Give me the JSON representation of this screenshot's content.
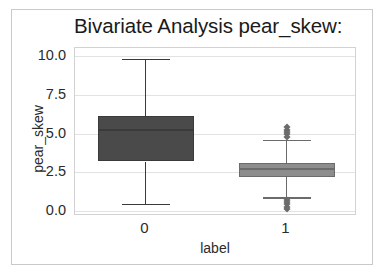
{
  "chart_data": {
    "type": "box",
    "title": "Bivariate Analysis pear_skew:",
    "xlabel": "label",
    "ylabel": "pear_skew",
    "ylim": [
      -0.3,
      10.5
    ],
    "yticks": [
      "0.0",
      "2.5",
      "5.0",
      "7.5",
      "10.0"
    ],
    "ytick_values": [
      0.0,
      2.5,
      5.0,
      7.5,
      10.0
    ],
    "categories": [
      "0",
      "1"
    ],
    "grid": true,
    "legend": "none",
    "boxes": [
      {
        "category": "0",
        "whisker_low": 0.5,
        "q1": 3.2,
        "median": 5.2,
        "q3": 6.1,
        "whisker_high": 9.8,
        "color": "#4a4a4a",
        "edge_color": "#3a3a3a",
        "outliers": []
      },
      {
        "category": "1",
        "whisker_low": 0.9,
        "q1": 2.2,
        "median": 2.75,
        "q3": 3.1,
        "whisker_high": 4.6,
        "color": "#8d8d8d",
        "edge_color": "#6b6b6b",
        "outliers": [
          5.4,
          5.25,
          5.1,
          4.95,
          4.8,
          0.75,
          0.6,
          0.45,
          0.3,
          0.15
        ]
      }
    ]
  },
  "figure": {
    "background_color": "#ffffff",
    "plot_background_color": "#ffffff",
    "grid_color": "#e2e2e2",
    "border_color": "#c9c9c9"
  }
}
